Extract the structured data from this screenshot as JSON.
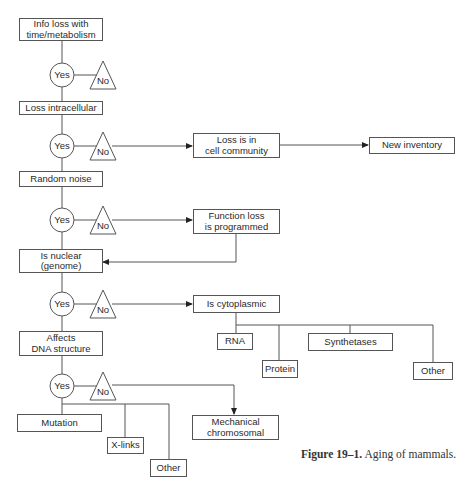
{
  "diagram": {
    "decision": {
      "yes_label": "Yes",
      "no_label": "No"
    },
    "main_column": [
      {
        "id": "info_loss",
        "label": "Info loss with\ntime/metabolism"
      },
      {
        "id": "loss_intracellular",
        "label": "Loss intracellular"
      },
      {
        "id": "random_noise",
        "label": "Random noise"
      },
      {
        "id": "is_nuclear",
        "label": "Is nuclear\n(genome)"
      },
      {
        "id": "affects_dna",
        "label": "Affects\nDNA structure"
      }
    ],
    "no_branches": [
      {
        "id": "cell_community",
        "label": "Loss is in\ncell community"
      },
      {
        "id": "new_inventory",
        "label": "New inventory"
      },
      {
        "id": "function_loss",
        "label": "Function loss\nis programmed"
      },
      {
        "id": "cytoplasmic",
        "label": "Is cytoplasmic"
      },
      {
        "id": "mechanical",
        "label": "Mechanical\nchromosomal"
      }
    ],
    "cytoplasmic_children": [
      {
        "id": "rna",
        "label": "RNA"
      },
      {
        "id": "protein",
        "label": "Protein"
      },
      {
        "id": "synthetases",
        "label": "Synthetases"
      },
      {
        "id": "cyto_other",
        "label": "Other"
      }
    ],
    "dna_children": [
      {
        "id": "mutation",
        "label": "Mutation"
      },
      {
        "id": "x_links",
        "label": "X-links"
      },
      {
        "id": "dna_other",
        "label": "Other"
      }
    ],
    "edges": [
      [
        "info_loss",
        "decision1"
      ],
      [
        "decision1",
        "loss_intracellular"
      ],
      [
        "decision1:no",
        "end"
      ],
      [
        "loss_intracellular",
        "decision2"
      ],
      [
        "decision2",
        "random_noise"
      ],
      [
        "decision2:no",
        "cell_community"
      ],
      [
        "cell_community",
        "new_inventory"
      ],
      [
        "random_noise",
        "decision3"
      ],
      [
        "decision3",
        "is_nuclear"
      ],
      [
        "decision3:no",
        "function_loss"
      ],
      [
        "function_loss",
        "is_nuclear"
      ],
      [
        "is_nuclear",
        "decision4"
      ],
      [
        "decision4",
        "affects_dna"
      ],
      [
        "decision4:no",
        "cytoplasmic"
      ],
      [
        "cytoplasmic",
        "rna"
      ],
      [
        "cytoplasmic",
        "protein"
      ],
      [
        "cytoplasmic",
        "synthetases"
      ],
      [
        "cytoplasmic",
        "cyto_other"
      ],
      [
        "affects_dna",
        "decision5"
      ],
      [
        "decision5",
        "mutation"
      ],
      [
        "decision5",
        "x_links"
      ],
      [
        "decision5",
        "dna_other"
      ],
      [
        "decision5:no",
        "mechanical"
      ]
    ]
  },
  "caption": {
    "figure_label": "Figure 19–1.",
    "text": "Aging of mammals."
  }
}
